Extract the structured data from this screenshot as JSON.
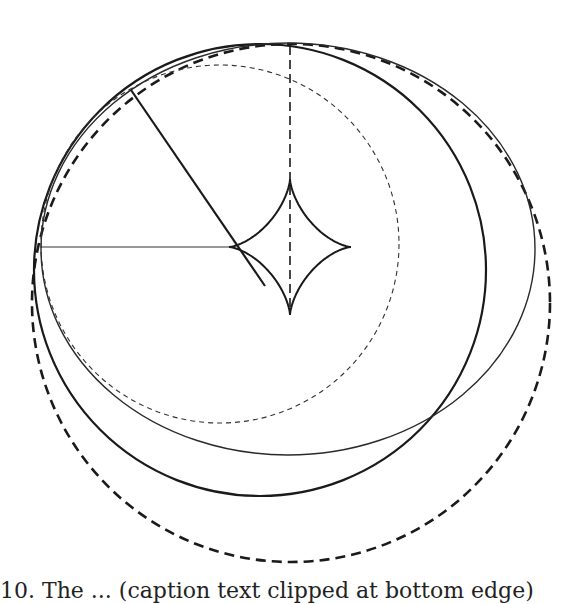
{
  "figure": {
    "stroke_color": "#1a1a1a",
    "background": "#ffffff",
    "elements": {
      "thick_dashed_circle": {
        "cx": 291,
        "cy": 303,
        "r": 259
      },
      "thick_solid_circle": {
        "cx": 260,
        "cy": 270,
        "r": 226
      },
      "thin_solid_ellipse": {
        "cx": 288,
        "cy": 249,
        "rx": 247,
        "ry": 206
      },
      "thin_dashed_circle": {
        "cx": 220,
        "cy": 244,
        "r": 179
      },
      "astroid": {
        "cx": 290,
        "cy": 247,
        "rx": 61,
        "ry": 68
      },
      "vertical_dashed_line": {
        "x": 290,
        "y1": 46,
        "y2": 315
      },
      "horizontal_line": {
        "x1": 41,
        "y1": 247,
        "x2": 229,
        "y2": 247
      },
      "diagonal_line": {
        "x1": 131,
        "y1": 90,
        "x2": 265,
        "y2": 286
      },
      "tick_mark": {
        "x1": 131,
        "y1": 90,
        "x2": 128,
        "y2": 86
      }
    }
  },
  "caption": {
    "text": "10.  The  ...  (caption text clipped at bottom edge)"
  }
}
